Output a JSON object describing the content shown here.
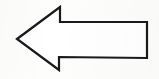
{
  "image": {
    "kind": "scanned-line-drawing",
    "subject": "left-pointing arrow outline",
    "alt_text": "Left pointing arrow",
    "width": 159,
    "height": 79,
    "background_color": "#fdfdfc",
    "stroke_color": "#1a1a1a",
    "fill_color": "#ffffff",
    "stroke_width": 2.2,
    "direction": "left",
    "text_labels": [],
    "shape": {
      "name": "arrow-left",
      "points": "17,39 60,7 60,22 147,22 147,58 59,57 59,70",
      "vertices": [
        {
          "name": "tip",
          "x": 17,
          "y": 39
        },
        {
          "name": "head-top",
          "x": 60,
          "y": 7
        },
        {
          "name": "shoulder-top",
          "x": 60,
          "y": 22
        },
        {
          "name": "tail-top-right",
          "x": 147,
          "y": 22
        },
        {
          "name": "tail-bottom-right",
          "x": 147,
          "y": 58
        },
        {
          "name": "shoulder-bottom",
          "x": 59,
          "y": 57
        },
        {
          "name": "head-bottom",
          "x": 59,
          "y": 70
        }
      ]
    }
  }
}
